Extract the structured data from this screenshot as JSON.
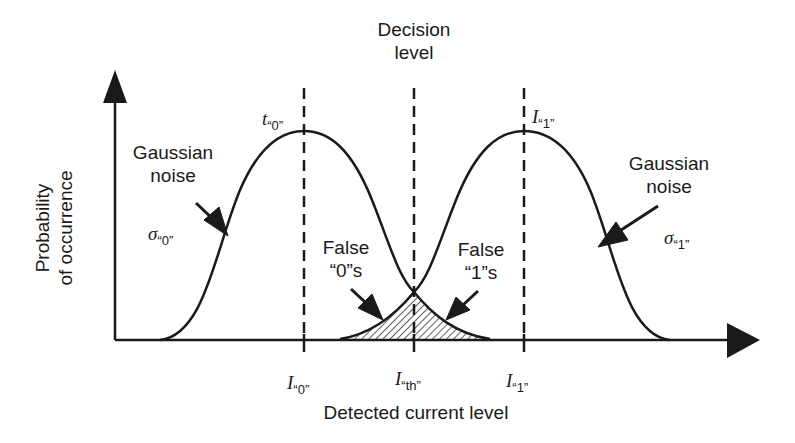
{
  "diagram": {
    "title": "Decision level",
    "title_lines": [
      "Decision",
      "level"
    ],
    "y_axis_label_lines": [
      "Probability",
      "of occurrence"
    ],
    "x_axis_label": "Detected current level",
    "left_curve": {
      "peak_label_main": "t",
      "peak_label_sub": "“0”",
      "noise_label_lines": [
        "Gaussian",
        "noise"
      ],
      "sigma_main": "σ",
      "sigma_sub": "“0”"
    },
    "right_curve": {
      "peak_label_main": "I",
      "peak_label_sub": "“1”",
      "noise_label_lines": [
        "Gaussian",
        "noise"
      ],
      "sigma_main": "σ",
      "sigma_sub": "“1”"
    },
    "false_zeros_lines": [
      "False",
      "“0”s"
    ],
    "false_ones_lines": [
      "False",
      "“1”s"
    ],
    "ticks": [
      {
        "main": "I",
        "sub": "“0”"
      },
      {
        "main": "I",
        "sub": "“th”"
      },
      {
        "main": "I",
        "sub": "“1”"
      }
    ],
    "colors": {
      "ink": "#1a1a1a",
      "background": "#ffffff"
    }
  }
}
